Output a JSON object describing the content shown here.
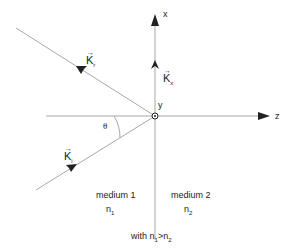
{
  "axes": {
    "x_label": "x",
    "y_label": "y",
    "z_label": "z"
  },
  "vectors": {
    "reflected": {
      "symbol": "K",
      "sub": "r"
    },
    "incident": {
      "symbol": "K",
      "sub": "i"
    },
    "transmitted": {
      "symbol": "K",
      "sub": "x"
    }
  },
  "angle_label": "θ",
  "media": {
    "left": {
      "name": "medium 1",
      "n": "n",
      "n_sub": "1"
    },
    "right": {
      "name": "medium  2",
      "n": "n",
      "n_sub": "2"
    }
  },
  "condition": {
    "prefix": "with  ",
    "a": "n",
    "a_sub": "1",
    "op": ">",
    "b": "n",
    "b_sub": "2"
  },
  "colors": {
    "line": "#a8a8a8",
    "arrow": "#222222"
  }
}
